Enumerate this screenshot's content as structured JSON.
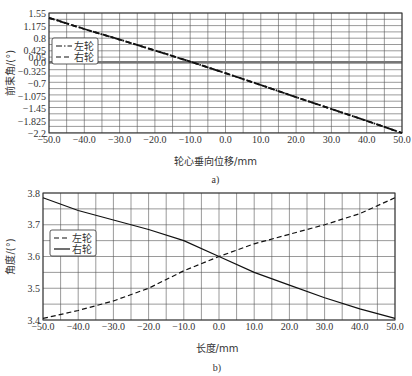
{
  "chart_data": [
    {
      "type": "line",
      "caption": "a)",
      "xlabel": "轮心垂向位移/mm",
      "ylabel": "前束角/(°)",
      "xlim": [
        -50,
        50
      ],
      "ylim": [
        -2.2,
        1.55
      ],
      "x_ticks": [
        "-50.0",
        "-40.0",
        "-30.0",
        "-20.0",
        "-10.0",
        "0.0",
        "10.0",
        "20.0",
        "30.0",
        "40.0",
        "50.0"
      ],
      "y_ticks": [
        "1.55",
        "1.175",
        "0.8",
        "0.425",
        "0.05",
        "0.0",
        "-0.325",
        "-0.7",
        "-1.075",
        "-1.45",
        "-1.825",
        "-2.2"
      ],
      "grid": true,
      "legend_position": "upper-left",
      "x": [
        -50,
        -40,
        -30,
        -20,
        -10,
        0,
        10,
        20,
        30,
        40,
        50
      ],
      "series": [
        {
          "name": "左轮",
          "style": "dash-dot",
          "values": [
            1.4,
            1.05,
            0.72,
            0.38,
            0.03,
            -0.33,
            -0.7,
            -1.08,
            -1.45,
            -1.82,
            -2.2
          ]
        },
        {
          "name": "右轮",
          "style": "dashed",
          "values": [
            1.4,
            1.05,
            0.72,
            0.38,
            0.03,
            -0.33,
            -0.7,
            -1.08,
            -1.45,
            -1.82,
            -2.2
          ]
        }
      ]
    },
    {
      "type": "line",
      "caption": "b)",
      "xlabel": "长度/mm",
      "ylabel": "角度/(°)",
      "xlim": [
        -50,
        50
      ],
      "ylim": [
        3.4,
        3.8
      ],
      "x_ticks": [
        "-50.0",
        "-40.0",
        "-30.0",
        "-20.0",
        "-10.0",
        "0.0",
        "10.0",
        "20.0",
        "30.0",
        "40.0",
        "50.0"
      ],
      "y_ticks": [
        "3.8",
        "3.7",
        "3.6",
        "3.5",
        "3.4"
      ],
      "grid": true,
      "legend_position": "upper-left",
      "x": [
        -50,
        -40,
        -30,
        -20,
        -10,
        0,
        10,
        20,
        30,
        40,
        50
      ],
      "series": [
        {
          "name": "左轮",
          "style": "dashed",
          "values": [
            3.405,
            3.43,
            3.46,
            3.5,
            3.555,
            3.6,
            3.64,
            3.67,
            3.7,
            3.735,
            3.785
          ]
        },
        {
          "name": "右轮",
          "style": "solid",
          "values": [
            3.785,
            3.745,
            3.715,
            3.685,
            3.65,
            3.6,
            3.55,
            3.51,
            3.47,
            3.435,
            3.405
          ]
        }
      ]
    }
  ]
}
